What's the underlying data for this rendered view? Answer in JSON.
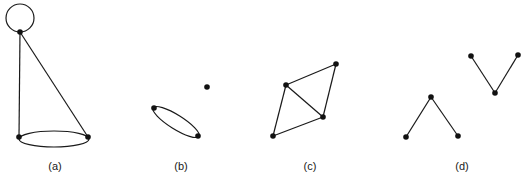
{
  "diagram": {
    "title": "",
    "panels": [
      {
        "id": "a",
        "label": "(a)",
        "label_pos": [
          55,
          160
        ],
        "nodes": [
          [
            20,
            32
          ],
          [
            19,
            137
          ],
          [
            88,
            137
          ]
        ],
        "edges": [
          [
            0,
            1
          ],
          [
            0,
            2
          ]
        ],
        "loops": [
          {
            "node": 0,
            "cx": 20,
            "cy": 18,
            "r": 14
          }
        ],
        "multi_edges": [
          {
            "between": [
              1,
              2
            ],
            "cx": 54,
            "cy": 139,
            "rx": 35,
            "ry": 8
          }
        ]
      },
      {
        "id": "b",
        "label": "(b)",
        "label_pos": [
          181,
          160
        ],
        "nodes": [
          [
            207,
            87
          ],
          [
            154,
            108
          ],
          [
            198,
            136
          ]
        ],
        "edges": [],
        "multi_edges": [
          {
            "between": [
              1,
              2
            ],
            "cx": 176,
            "cy": 122,
            "rx": 27,
            "ry": 7,
            "rotate": 32
          }
        ]
      },
      {
        "id": "c",
        "label": "(c)",
        "label_pos": [
          310,
          160
        ],
        "nodes": [
          [
            336,
            64
          ],
          [
            286,
            85
          ],
          [
            323,
            117
          ],
          [
            273,
            136
          ]
        ],
        "edges": [
          [
            1,
            0
          ],
          [
            0,
            2
          ],
          [
            1,
            2
          ],
          [
            1,
            3
          ],
          [
            3,
            2
          ]
        ]
      },
      {
        "id": "d",
        "label": "(d)",
        "label_pos": [
          462,
          160
        ],
        "nodes": [
          [
            406,
            137
          ],
          [
            431,
            97
          ],
          [
            458,
            136
          ],
          [
            471,
            56
          ],
          [
            495,
            93
          ],
          [
            518,
            55
          ]
        ],
        "edges": [
          [
            0,
            1
          ],
          [
            1,
            2
          ],
          [
            3,
            4
          ],
          [
            4,
            5
          ]
        ]
      }
    ],
    "colors": {
      "stroke": "#1a1a1a",
      "node": "#111111",
      "background": "#ffffff"
    }
  }
}
